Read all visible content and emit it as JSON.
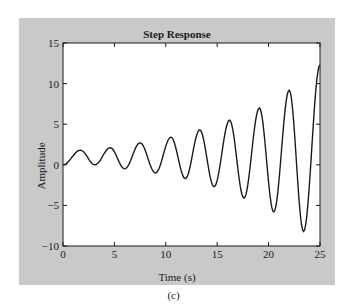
{
  "caption": "(c)",
  "chart_data": {
    "type": "line",
    "title": "Step Response",
    "xlabel": "Time (s)",
    "ylabel": "Amplitude",
    "xlim": [
      0,
      25
    ],
    "ylim": [
      -10,
      15
    ],
    "x_ticks": [
      0,
      5,
      10,
      15,
      20,
      25
    ],
    "y_ticks": [
      -10,
      -5,
      0,
      5,
      10,
      15
    ],
    "x_tick_labels": [
      "0",
      "5",
      "10",
      "15",
      "20",
      "25"
    ],
    "y_tick_labels": [
      "−10",
      "−5",
      "0",
      "5",
      "10",
      "15"
    ],
    "grid": false,
    "legend": null,
    "series": [
      {
        "name": "Step Response",
        "color": "#1a1a1a",
        "extrema": [
          [
            0,
            0
          ],
          [
            1.7,
            1.8
          ],
          [
            3.1,
            0.0
          ],
          [
            4.6,
            2.1
          ],
          [
            6.0,
            -0.5
          ],
          [
            7.5,
            2.7
          ],
          [
            9.0,
            -1.0
          ],
          [
            10.5,
            3.4
          ],
          [
            11.9,
            -1.7
          ],
          [
            13.3,
            4.3
          ],
          [
            14.7,
            -2.7
          ],
          [
            16.2,
            5.5
          ],
          [
            17.6,
            -4.1
          ],
          [
            19.1,
            7.0
          ],
          [
            20.5,
            -5.8
          ],
          [
            22.0,
            9.2
          ],
          [
            23.4,
            -8.2
          ],
          [
            25.0,
            12.3
          ]
        ]
      }
    ]
  },
  "colors": {
    "panel_background": "#c9c9c9",
    "plot_background": "#ffffff",
    "line": "#1a1a1a"
  }
}
